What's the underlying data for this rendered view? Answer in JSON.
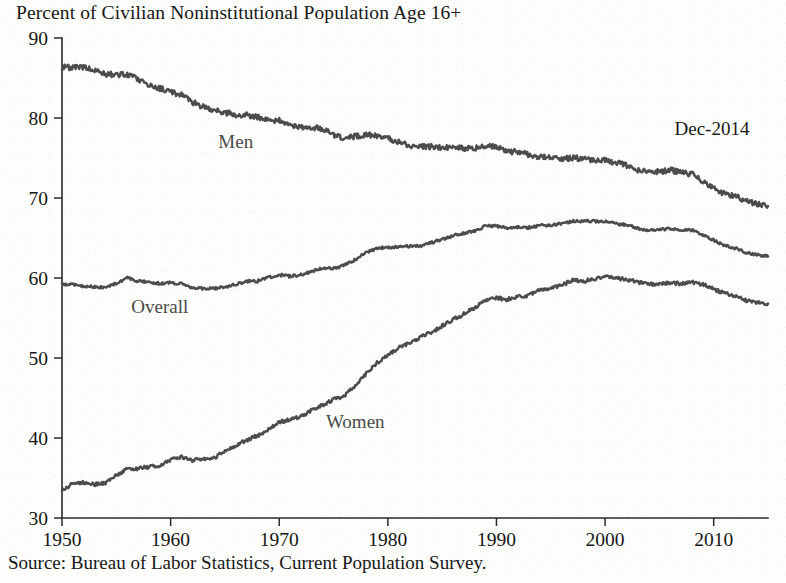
{
  "chart_data": {
    "type": "line",
    "title": "Percent of Civilian Noninstitutional Population Age 16+",
    "subtitle": "",
    "xlabel": "",
    "ylabel": "",
    "source": "Source: Bureau of Labor Statistics, Current Population Survey.",
    "annotation": "Dec-2014",
    "grid": false,
    "legend_position": "inline-labels",
    "xlim": [
      1950,
      2015
    ],
    "ylim": [
      30,
      90
    ],
    "xticks": [
      1950,
      1960,
      1970,
      1980,
      1990,
      2000,
      2010
    ],
    "xtick_labels": [
      "1950",
      "1960",
      "1970",
      "1980",
      "1990",
      "2000",
      "2010"
    ],
    "yticks": [
      30,
      40,
      50,
      60,
      70,
      80,
      90
    ],
    "ytick_labels": [
      "30",
      "40",
      "50",
      "60",
      "70",
      "80",
      "90"
    ],
    "line_color": "#4c4c4c",
    "axis_color": "#2a2a2a",
    "x": [
      1950,
      1951,
      1952,
      1953,
      1954,
      1955,
      1956,
      1957,
      1958,
      1959,
      1960,
      1961,
      1962,
      1963,
      1964,
      1965,
      1966,
      1967,
      1968,
      1969,
      1970,
      1971,
      1972,
      1973,
      1974,
      1975,
      1976,
      1977,
      1978,
      1979,
      1980,
      1981,
      1982,
      1983,
      1984,
      1985,
      1986,
      1987,
      1988,
      1989,
      1990,
      1991,
      1992,
      1993,
      1994,
      1995,
      1996,
      1997,
      1998,
      1999,
      2000,
      2001,
      2002,
      2003,
      2004,
      2005,
      2006,
      2007,
      2008,
      2009,
      2010,
      2011,
      2012,
      2013,
      2014,
      2015
    ],
    "series": [
      {
        "name": "Men",
        "label": "Men",
        "label_x": 1966,
        "label_y": 76.3,
        "values": [
          86.4,
          86.3,
          86.3,
          86.0,
          85.5,
          85.4,
          85.5,
          84.8,
          84.2,
          83.7,
          83.3,
          82.9,
          82.0,
          81.4,
          81.0,
          80.7,
          80.4,
          80.4,
          80.1,
          79.8,
          79.7,
          79.1,
          78.9,
          78.8,
          78.7,
          77.9,
          77.5,
          77.7,
          77.9,
          77.8,
          77.4,
          77.0,
          76.6,
          76.4,
          76.4,
          76.3,
          76.3,
          76.2,
          76.2,
          76.4,
          76.4,
          75.8,
          75.8,
          75.4,
          75.1,
          75.0,
          74.9,
          75.0,
          74.9,
          74.7,
          74.8,
          74.4,
          74.1,
          73.5,
          73.3,
          73.3,
          73.5,
          73.2,
          73.0,
          72.0,
          71.2,
          70.5,
          70.2,
          69.7,
          69.2,
          69.0
        ]
      },
      {
        "name": "Overall",
        "label": "Overall",
        "label_x": 1959,
        "label_y": 55.6,
        "values": [
          59.2,
          59.2,
          59.0,
          58.9,
          58.8,
          59.3,
          60.0,
          59.6,
          59.5,
          59.3,
          59.4,
          59.3,
          58.8,
          58.7,
          58.7,
          58.9,
          59.2,
          59.6,
          59.6,
          60.1,
          60.4,
          60.2,
          60.4,
          60.8,
          61.3,
          61.2,
          61.6,
          62.3,
          63.2,
          63.7,
          63.8,
          63.9,
          64.0,
          64.0,
          64.4,
          64.8,
          65.3,
          65.6,
          65.9,
          66.5,
          66.5,
          66.2,
          66.4,
          66.3,
          66.6,
          66.6,
          66.8,
          67.1,
          67.1,
          67.1,
          67.1,
          66.8,
          66.6,
          66.2,
          66.0,
          66.0,
          66.2,
          66.0,
          66.0,
          65.4,
          64.7,
          64.1,
          63.7,
          63.2,
          62.9,
          62.7
        ]
      },
      {
        "name": "Women",
        "label": "Women",
        "label_x": 1977,
        "label_y": 41.3,
        "values": [
          33.4,
          34.3,
          34.4,
          34.2,
          34.4,
          35.3,
          36.1,
          36.2,
          36.4,
          36.5,
          37.3,
          37.6,
          37.2,
          37.4,
          37.5,
          38.4,
          39.1,
          39.7,
          40.3,
          41.0,
          42.0,
          42.3,
          42.7,
          43.5,
          44.1,
          44.8,
          45.3,
          46.5,
          48.0,
          49.4,
          50.4,
          51.3,
          51.9,
          52.6,
          53.2,
          54.0,
          54.8,
          55.5,
          56.3,
          57.2,
          57.5,
          57.3,
          57.7,
          57.8,
          58.6,
          58.7,
          59.1,
          59.7,
          59.6,
          59.9,
          60.2,
          60.0,
          59.8,
          59.5,
          59.2,
          59.3,
          59.4,
          59.3,
          59.5,
          59.2,
          58.6,
          58.1,
          57.7,
          57.2,
          56.9,
          56.8
        ]
      }
    ]
  },
  "axis": {
    "y_top_label": "90",
    "y_bottom_label": "30"
  }
}
